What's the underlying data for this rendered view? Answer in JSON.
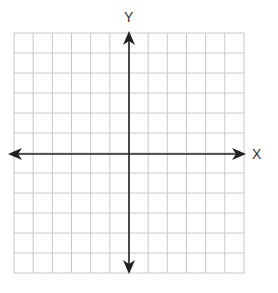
{
  "diagram": {
    "type": "coordinate-plane",
    "x_axis_label": "X",
    "y_axis_label": "Y",
    "grid": {
      "columns": 12,
      "rows": 12
    },
    "colors": {
      "grid": "#c8c8c8",
      "axis": "#222222",
      "label": "#333333"
    }
  }
}
